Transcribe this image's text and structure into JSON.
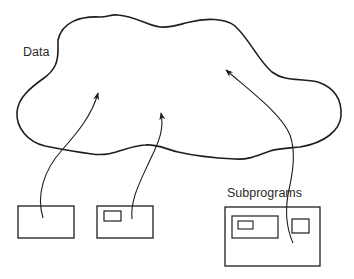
{
  "diagram": {
    "labels": {
      "data": "Data",
      "subprograms": "Subprograms"
    },
    "colors": {
      "stroke": "#1e1e1e",
      "text": "#2a2a2a",
      "background": "#ffffff"
    },
    "nodes": [
      {
        "id": "data-cloud",
        "label": "Data",
        "shape": "cloud"
      },
      {
        "id": "program-box-1",
        "shape": "rectangle",
        "children": []
      },
      {
        "id": "program-box-2",
        "shape": "rectangle",
        "children": [
          "inner-rect"
        ]
      },
      {
        "id": "subprograms-box",
        "label": "Subprograms",
        "shape": "rectangle",
        "children": [
          "nested-box-with-inner-rect",
          "small-rect"
        ]
      }
    ],
    "edges": [
      {
        "from": "program-box-1",
        "to": "data-cloud",
        "type": "arrow"
      },
      {
        "from": "program-box-2",
        "to": "data-cloud",
        "type": "arrow"
      },
      {
        "from": "subprograms-box",
        "to": "data-cloud",
        "type": "arrow"
      }
    ]
  }
}
